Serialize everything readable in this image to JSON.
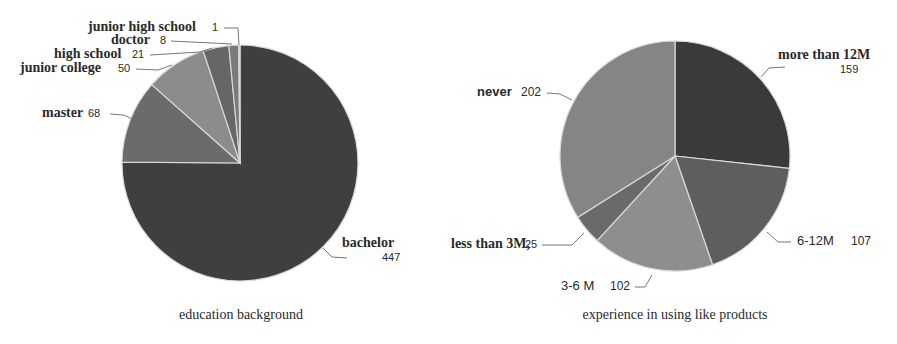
{
  "chart_data": [
    {
      "type": "pie",
      "title": "education background",
      "start_angle_deg": 0,
      "direction": "clockwise",
      "categories": [
        "bachelor",
        "master",
        "junior college",
        "high school",
        "doctor",
        "junior high school"
      ],
      "values": [
        447,
        68,
        50,
        21,
        8,
        1
      ],
      "colors": [
        "#3f3f3f",
        "#6b6b6b",
        "#8c8c8c",
        "#666666",
        "#7a7a7a",
        "#8a8a8a"
      ],
      "labels": [
        {
          "name": "bachelor",
          "value": "447"
        },
        {
          "name": "master",
          "value": "68"
        },
        {
          "name": "junior college",
          "value": "50"
        },
        {
          "name": "high school",
          "value": "21"
        },
        {
          "name": "doctor",
          "value": "8"
        },
        {
          "name": "junior high school",
          "value": "1"
        }
      ],
      "legend": "none (direct labels with leader lines)"
    },
    {
      "type": "pie",
      "title": "experience in using like products",
      "start_angle_deg": 0,
      "direction": "clockwise",
      "categories": [
        "more than 12M",
        "6-12M",
        "3-6M",
        "less than 3M",
        "never"
      ],
      "values": [
        159,
        107,
        102,
        25,
        202
      ],
      "colors": [
        "#3a3a3a",
        "#5e5e5e",
        "#8e8e8e",
        "#6a6a6a",
        "#858585"
      ],
      "labels": [
        {
          "name": "more than 12M",
          "value": "159"
        },
        {
          "name": "6-12M",
          "value": "107"
        },
        {
          "name": "3-6 M",
          "value": "102"
        },
        {
          "name": "less than 3M,",
          "value": "25"
        },
        {
          "name": "never",
          "value": "202"
        }
      ],
      "legend": "none (direct labels with leader lines)"
    }
  ]
}
